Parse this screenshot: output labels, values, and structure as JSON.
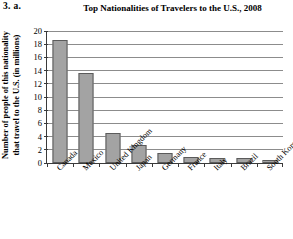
{
  "problem_number": "3. a.",
  "chart_data": {
    "type": "bar",
    "title": "Top Nationalities of Travelers to the U.S., 2008",
    "xlabel": "",
    "ylabel": "Number of people of this nationality\nthat travel to the U.S. (in millions)",
    "ylim": [
      0,
      20
    ],
    "ytick_step": 2,
    "yticks": [
      "20",
      "18",
      "16",
      "14",
      "12",
      "10",
      "8",
      "6",
      "4",
      "2",
      "0"
    ],
    "grid": true,
    "legend": "none",
    "bar_color": "#a3a3a3",
    "bar_border_color": "#5b5b5b",
    "axis_color": "#3a3a3a",
    "gridline_color": "#8c8c8c",
    "categories": [
      "Canada",
      "Mexico",
      "United Kingdom",
      "Japan",
      "Germany",
      "France",
      "Italy",
      "Brazil",
      "South Korea"
    ],
    "values": [
      18.7,
      13.7,
      4.5,
      2.8,
      1.5,
      0.9,
      0.8,
      0.7,
      0.5
    ]
  }
}
